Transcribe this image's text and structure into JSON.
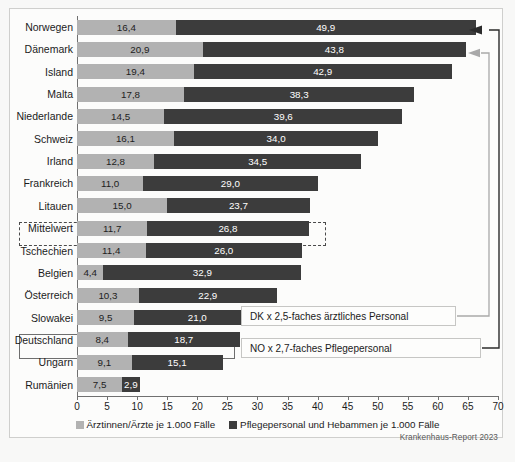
{
  "source": "Krankenhaus-Report 2023",
  "legend": {
    "items": [
      {
        "label": "Ärztinnen/Ärzte je 1.000 Fälle",
        "color": "#b2b2b2",
        "key": "doctors"
      },
      {
        "label": "Pflegepersonal und Hebammen je 1.000 Fälle",
        "color": "#3c3c3c",
        "key": "nurses"
      }
    ]
  },
  "annotations": [
    {
      "id": "dk",
      "text": "DK x 2,5-faches ärztliches Personal"
    },
    {
      "id": "no",
      "text": "NO x 2,7-faches Pflegepersonal"
    }
  ],
  "highlights": [
    {
      "id": "mittelwert",
      "category": "Mittelwert",
      "style": "dashed"
    },
    {
      "id": "deutschland",
      "category": "Deutschland",
      "style": "solid"
    }
  ],
  "chart_data": {
    "type": "bar",
    "orientation": "horizontal",
    "stacked": true,
    "title": "",
    "subtitle": "",
    "xlabel": "",
    "ylabel": "",
    "xlim": [
      0,
      70
    ],
    "xticks": [
      0,
      5,
      10,
      15,
      20,
      25,
      30,
      35,
      40,
      45,
      50,
      55,
      60,
      65,
      70
    ],
    "xtick_labels": [
      "0",
      "5",
      "10",
      "15",
      "20",
      "25",
      "30",
      "35",
      "40",
      "45",
      "50",
      "55",
      "60",
      "65",
      "70"
    ],
    "grid": false,
    "legend_position": "bottom",
    "categories": [
      "Norwegen",
      "Dänemark",
      "Island",
      "Malta",
      "Niederlande",
      "Schweiz",
      "Irland",
      "Frankreich",
      "Litauen",
      "Mittelwert",
      "Tschechien",
      "Belgien",
      "Österreich",
      "Slowakei",
      "Deutschland",
      "Ungarn",
      "Rumänien"
    ],
    "series": [
      {
        "name": "Ärztinnen/Ärzte je 1.000 Fälle",
        "key": "doctors",
        "color": "#b2b2b2",
        "values": [
          16.4,
          20.9,
          19.4,
          17.8,
          14.5,
          16.1,
          12.8,
          11.0,
          15.0,
          11.7,
          11.4,
          4.4,
          10.3,
          9.5,
          8.4,
          9.1,
          7.5
        ],
        "labels": [
          "16,4",
          "20,9",
          "19,4",
          "17,8",
          "14,5",
          "16,1",
          "12,8",
          "11,0",
          "15,0",
          "11,7",
          "11,4",
          "4,4",
          "10,3",
          "9,5",
          "8,4",
          "9,1",
          "7,5"
        ]
      },
      {
        "name": "Pflegepersonal und Hebammen je 1.000 Fälle",
        "key": "nurses",
        "color": "#3c3c3c",
        "values": [
          49.9,
          43.8,
          42.9,
          38.3,
          39.6,
          34.0,
          34.5,
          29.0,
          23.7,
          26.8,
          26.0,
          32.9,
          22.9,
          21.0,
          18.7,
          15.1,
          2.9
        ],
        "labels": [
          "49,9",
          "43,8",
          "42,9",
          "38,3",
          "39,6",
          "34,0",
          "34,5",
          "29,0",
          "23,7",
          "26,8",
          "26,0",
          "32,9",
          "22,9",
          "21,0",
          "18,7",
          "15,1",
          "2,9"
        ]
      }
    ]
  }
}
